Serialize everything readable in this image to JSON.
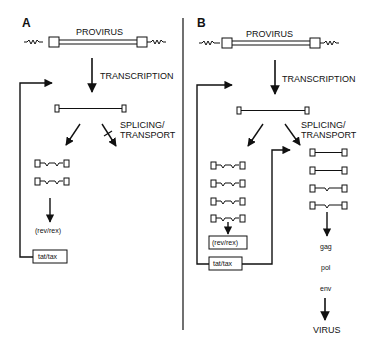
{
  "panels": [
    {
      "id": "A",
      "label": "A",
      "provirus_label": "PROVIRUS",
      "transcription_label": "TRANSCRIPTION",
      "splicing_label_1": "SPLICING/",
      "splicing_label_2": "TRANSPORT",
      "spliced_count": 2,
      "regulator_label": "(rev/rex)",
      "feedback_box_label": "tat/tax"
    },
    {
      "id": "B",
      "label": "B",
      "provirus_label": "PROVIRUS",
      "transcription_label": "TRANSCRIPTION",
      "splicing_label_1": "SPLICING/",
      "splicing_label_2": "TRANSPORT",
      "spliced_count": 4,
      "unspliced_count": 4,
      "regulator_box_label": "(rev/rex)",
      "feedback_box_label": "tat/tax",
      "products": [
        "gag",
        "pol",
        "env"
      ],
      "final_label": "VIRUS"
    }
  ],
  "colors": {
    "ink": "#111111",
    "background": "#ffffff"
  }
}
